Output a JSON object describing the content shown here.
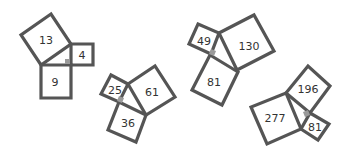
{
  "diagram": {
    "title": "",
    "figures": [
      {
        "name": "figure-1",
        "squares": [
          {
            "label": "13",
            "points": "51,14 21,35 41,65 71,44",
            "cx": 46,
            "cy": 40
          },
          {
            "label": "4",
            "points": "71,44 93,44 93,65 71,65",
            "cx": 82,
            "cy": 55
          },
          {
            "label": "9",
            "points": "41,65 71,65 71,98 41,98",
            "cx": 55,
            "cy": 82
          }
        ],
        "right_angle": "65,59 70,59 70,64 65,64"
      },
      {
        "name": "figure-2",
        "squares": [
          {
            "label": "25",
            "points": "111,75 128,84 119,102 101,94",
            "cx": 115,
            "cy": 89
          },
          {
            "label": "61",
            "points": "128,84 155,66 175,97 146,115",
            "cx": 152,
            "cy": 92
          },
          {
            "label": "36",
            "points": "119,102 146,115 136,142 108,130",
            "cx": 128,
            "cy": 123
          }
        ],
        "right_angle": "119,96 124,98 122,103 117,101"
      },
      {
        "name": "figure-3",
        "squares": [
          {
            "label": "49",
            "points": "198,24 219,33 211,54 189,44",
            "cx": 204,
            "cy": 41
          },
          {
            "label": "130",
            "points": "219,33 254,15 274,51 237,70",
            "cx": 249,
            "cy": 46
          },
          {
            "label": "81",
            "points": "210,55 238,72 222,105 192,90",
            "cx": 214,
            "cy": 82
          }
        ],
        "right_angle": "211,49 216,51 214,56 209,54"
      },
      {
        "name": "figure-4",
        "squares": [
          {
            "label": "196",
            "points": "286,93 308,66 330,86 310,113",
            "cx": 308,
            "cy": 89
          },
          {
            "label": "81",
            "points": "310,113 329,124 318,140 301,129",
            "cx": 315,
            "cy": 127
          },
          {
            "label": "277",
            "points": "286,93 301,129 267,144 251,107",
            "cx": 275,
            "cy": 118
          }
        ],
        "right_angle": "303,112 308,110 310,115 305,117"
      }
    ],
    "colors": {
      "stroke": "#555555",
      "right_angle_marker": "#9a9a9a",
      "label": "#333333",
      "background": "#ffffff"
    }
  }
}
